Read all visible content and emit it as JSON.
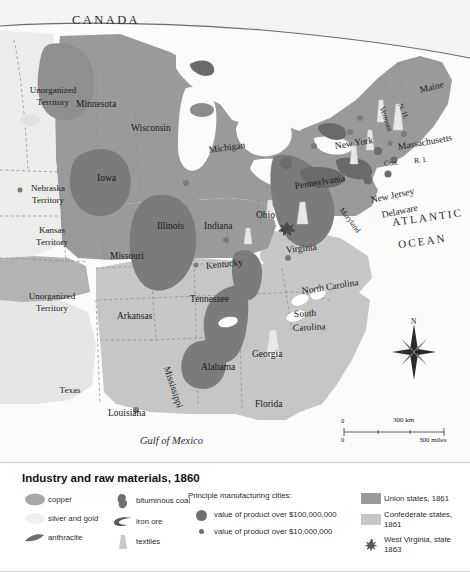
{
  "map": {
    "regions": {
      "canada_label": "C A N A D A",
      "ocean_label_line1": "ATLANTIC",
      "ocean_label_line2": "OCEAN",
      "gulf_label": "Gulf of Mexico"
    },
    "states": [
      {
        "name": "Minnesota",
        "x": 76,
        "y": 100,
        "rot": 0,
        "cls": "state"
      },
      {
        "name": "Wisconsin",
        "x": 131,
        "y": 124,
        "rot": 0,
        "cls": "state"
      },
      {
        "name": "Michigan",
        "x": 209,
        "y": 146,
        "rot": -8,
        "cls": "state"
      },
      {
        "name": "Iowa",
        "x": 97,
        "y": 174,
        "rot": 0,
        "cls": "state"
      },
      {
        "name": "Illinois",
        "x": 157,
        "y": 222,
        "rot": 0,
        "cls": "state"
      },
      {
        "name": "Indiana",
        "x": 204,
        "y": 222,
        "rot": 0,
        "cls": "state"
      },
      {
        "name": "Ohio",
        "x": 256,
        "y": 211,
        "rot": 0,
        "cls": "state"
      },
      {
        "name": "Missouri",
        "x": 110,
        "y": 252,
        "rot": 0,
        "cls": "state"
      },
      {
        "name": "Kentucky",
        "x": 206,
        "y": 262,
        "rot": -6,
        "cls": "state"
      },
      {
        "name": "Tennessee",
        "x": 190,
        "y": 295,
        "rot": 0,
        "cls": "state"
      },
      {
        "name": "Arkansas",
        "x": 117,
        "y": 312,
        "rot": 0,
        "cls": "state"
      },
      {
        "name": "Alabama",
        "x": 201,
        "y": 363,
        "rot": 0,
        "cls": "state"
      },
      {
        "name": "Georgia",
        "x": 252,
        "y": 350,
        "rot": 0,
        "cls": "state"
      },
      {
        "name": "Florida",
        "x": 255,
        "y": 400,
        "rot": 0,
        "cls": "state"
      },
      {
        "name": "Louisiana",
        "x": 108,
        "y": 409,
        "rot": 0,
        "cls": "state"
      },
      {
        "name": "Virginia",
        "x": 286,
        "y": 246,
        "rot": -6,
        "cls": "state"
      },
      {
        "name": "Pennsylvania",
        "x": 295,
        "y": 182,
        "rot": -9,
        "cls": "state"
      },
      {
        "name": "New York",
        "x": 335,
        "y": 142,
        "rot": -9,
        "cls": "state"
      },
      {
        "name": "New Jersey",
        "x": 371,
        "y": 196,
        "rot": -12,
        "cls": "state"
      },
      {
        "name": "Delaware",
        "x": 382,
        "y": 211,
        "rot": -12,
        "cls": "state"
      },
      {
        "name": "Maryland",
        "x": 341,
        "y": 205,
        "rot": 52,
        "cls": "small"
      },
      {
        "name": "Massachusetts",
        "x": 398,
        "y": 143,
        "rot": -10,
        "cls": "state"
      },
      {
        "name": "Maine",
        "x": 420,
        "y": 86,
        "rot": -14,
        "cls": "state"
      },
      {
        "name": "Vermont",
        "x": 382,
        "y": 103,
        "rot": 72,
        "cls": "small"
      },
      {
        "name": "N. H.",
        "x": 400,
        "y": 100,
        "rot": 66,
        "cls": "small"
      },
      {
        "name": "Con.",
        "x": 384,
        "y": 160,
        "rot": -5,
        "cls": "small"
      },
      {
        "name": "R. I.",
        "x": 414,
        "y": 157,
        "rot": -5,
        "cls": "small"
      },
      {
        "name": "North Carolina",
        "x": 302,
        "y": 287,
        "rot": -9,
        "cls": "state"
      },
      {
        "name": "South",
        "x": 294,
        "y": 310,
        "rot": -3,
        "cls": "state"
      },
      {
        "name": "Carolina",
        "x": 293,
        "y": 324,
        "rot": -3,
        "cls": "state"
      },
      {
        "name": "Mississippi",
        "x": 166,
        "y": 362,
        "rot": 72,
        "cls": "state"
      }
    ],
    "territories": [
      {
        "line1": "Unorganized",
        "line2": "Territory",
        "x": 14,
        "y": 86
      },
      {
        "line1": "Nebraska",
        "line2": "Territory",
        "x": 9,
        "y": 184
      },
      {
        "line1": "Kansas",
        "line2": "Territory",
        "x": 13,
        "y": 226
      },
      {
        "line1": "Unorganized",
        "line2": "Territory",
        "x": 13,
        "y": 292
      },
      {
        "line1": "Texas",
        "line2": "",
        "x": 31,
        "y": 386
      }
    ],
    "scale": {
      "zero_top": "0",
      "zero_bottom": "0",
      "km_label": "300 km",
      "miles_label": "300 miles"
    },
    "compass": {
      "north_label": "N"
    }
  },
  "legend": {
    "title": "Industry and raw materials, 1860",
    "resources_col1": [
      {
        "label": "copper",
        "icon": "copper-blob-icon"
      },
      {
        "label": "silver and gold",
        "icon": "silver-gold-icon"
      },
      {
        "label": "anthracite",
        "icon": "anthracite-icon"
      }
    ],
    "resources_col2": [
      {
        "label": "bituminous coal",
        "icon": "bituminous-coal-icon"
      },
      {
        "label": "iron ore",
        "icon": "iron-ore-icon"
      },
      {
        "label": "textiles",
        "icon": "textiles-icon"
      }
    ],
    "cities_heading": "Principle manufacturing cities:",
    "cities": [
      {
        "label": "value of product over $100,000,000",
        "size": "large"
      },
      {
        "label": "value of product over $10,000,000",
        "size": "small"
      }
    ],
    "status": [
      {
        "label": "Union states, 1861",
        "swatch": "#9a9a9a",
        "type": "box"
      },
      {
        "label": "Confederate states, 1861",
        "swatch": "#c6c6c6",
        "type": "box"
      },
      {
        "label": "West Virginia, state 1863",
        "swatch": "",
        "type": "hatch"
      }
    ]
  },
  "colors": {
    "union": "#9a9a9a",
    "confederate": "#c6c6c6",
    "territory_light": "#ececea",
    "territory_mid": "#b3b3b3",
    "water": "#fbfbfa",
    "resource_dark": "#7b7b7b",
    "city_dot": "#6f6f6f"
  }
}
